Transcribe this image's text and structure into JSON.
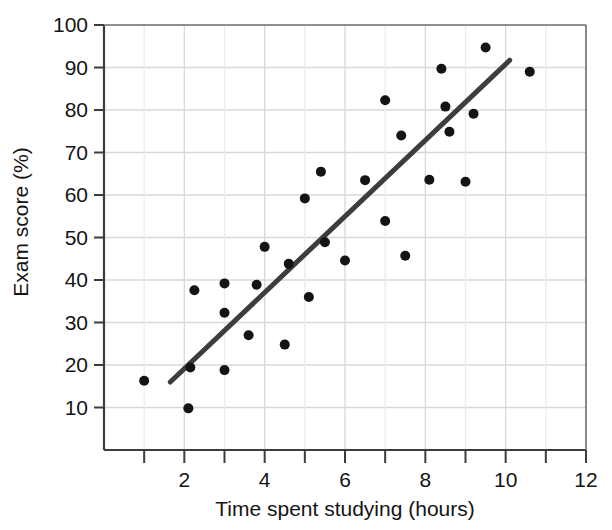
{
  "chart_data": {
    "type": "scatter",
    "title": "",
    "xlabel": "Time spent studying (hours)",
    "ylabel": "Exam score (%)",
    "xlim": [
      0,
      12
    ],
    "ylim": [
      0,
      100
    ],
    "xticks": [
      2,
      4,
      6,
      8,
      10,
      12
    ],
    "xticks_minor": [
      1,
      3,
      5,
      7,
      9,
      11
    ],
    "yticks": [
      10,
      20,
      30,
      40,
      50,
      60,
      70,
      80,
      90,
      100
    ],
    "xtick_labels": [
      "2",
      "4",
      "6",
      "8",
      "10",
      "12"
    ],
    "ytick_labels": [
      "10",
      "20",
      "30",
      "40",
      "50",
      "60",
      "70",
      "80",
      "90",
      "100"
    ],
    "grid": true,
    "legend": false,
    "marker_color": "#141414",
    "marker_size": 5,
    "trendline": {
      "label": "line of best fit",
      "color": "#3d3d3d",
      "width": 5,
      "x_start": 1.65,
      "y_start": 16.0,
      "x_end": 10.1,
      "y_end": 91.7
    },
    "points": [
      {
        "x": 1.0,
        "y": 16.3
      },
      {
        "x": 2.1,
        "y": 9.8
      },
      {
        "x": 2.15,
        "y": 19.4
      },
      {
        "x": 2.25,
        "y": 37.6
      },
      {
        "x": 3.0,
        "y": 18.8
      },
      {
        "x": 3.0,
        "y": 32.3
      },
      {
        "x": 3.0,
        "y": 39.2
      },
      {
        "x": 3.6,
        "y": 27.0
      },
      {
        "x": 3.8,
        "y": 38.9
      },
      {
        "x": 4.0,
        "y": 47.8
      },
      {
        "x": 4.5,
        "y": 24.8
      },
      {
        "x": 4.6,
        "y": 43.8
      },
      {
        "x": 5.0,
        "y": 59.2
      },
      {
        "x": 5.1,
        "y": 36.0
      },
      {
        "x": 5.4,
        "y": 65.5
      },
      {
        "x": 5.5,
        "y": 48.9
      },
      {
        "x": 6.0,
        "y": 44.6
      },
      {
        "x": 6.5,
        "y": 63.5
      },
      {
        "x": 7.0,
        "y": 82.3
      },
      {
        "x": 7.0,
        "y": 53.9
      },
      {
        "x": 7.4,
        "y": 74.0
      },
      {
        "x": 7.5,
        "y": 45.7
      },
      {
        "x": 8.1,
        "y": 63.6
      },
      {
        "x": 8.4,
        "y": 89.7
      },
      {
        "x": 8.5,
        "y": 80.8
      },
      {
        "x": 8.6,
        "y": 74.9
      },
      {
        "x": 9.0,
        "y": 63.1
      },
      {
        "x": 9.2,
        "y": 79.1
      },
      {
        "x": 9.5,
        "y": 94.7
      },
      {
        "x": 10.6,
        "y": 89.0
      }
    ]
  }
}
